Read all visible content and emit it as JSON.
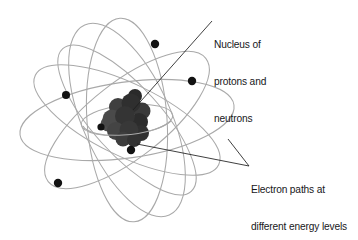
{
  "diagram": {
    "background_color": "#ffffff",
    "labels": {
      "nucleus": {
        "name": "nucleus-label",
        "lines": [
          "Nucleus of",
          "protons and",
          "neutrons"
        ],
        "line1": "Nucleus of",
        "line2": "protons and",
        "line3": "neutrons",
        "color": "#17171a"
      },
      "orbits": {
        "name": "electron-paths-label",
        "lines": [
          "Electron paths at",
          "different energy levels"
        ],
        "line1": "Electron paths at",
        "line2": "different energy levels",
        "color": "#17171a"
      }
    },
    "colors": {
      "orbit_stroke": "#a9a9a9",
      "electron_fill": "#121212",
      "nucleon_fill": "#3c3c3c",
      "nucleon_fill_dark": "#2b2b2b",
      "nucleon_fill_light": "#555555",
      "leader_line": "#1d1d1d"
    },
    "nucleus": {
      "center_x": 127,
      "center_y": 120,
      "nucleon_count": 13,
      "nucleons": [
        {
          "cx": 118,
          "cy": 107,
          "r": 9.0,
          "shade": "#3f3f3f"
        },
        {
          "cx": 131,
          "cy": 103,
          "r": 9.5,
          "shade": "#2f2f2f"
        },
        {
          "cx": 142,
          "cy": 111,
          "r": 8.5,
          "shade": "#3a3a3a"
        },
        {
          "cx": 112,
          "cy": 119,
          "r": 9.5,
          "shade": "#4a4a4a"
        },
        {
          "cx": 125,
          "cy": 116,
          "r": 10.0,
          "shade": "#343434"
        },
        {
          "cx": 139,
          "cy": 122,
          "r": 9.0,
          "shade": "#2c2c2c"
        },
        {
          "cx": 116,
          "cy": 131,
          "r": 9.0,
          "shade": "#444444"
        },
        {
          "cx": 129,
          "cy": 130,
          "r": 9.5,
          "shade": "#383838"
        },
        {
          "cx": 141,
          "cy": 133,
          "r": 8.0,
          "shade": "#303030"
        },
        {
          "cx": 123,
          "cy": 139,
          "r": 7.5,
          "shade": "#3d3d3d"
        },
        {
          "cx": 134,
          "cy": 140,
          "r": 7.0,
          "shade": "#333333"
        },
        {
          "cx": 108,
          "cy": 124,
          "r": 7.5,
          "shade": "#4f4f4f"
        },
        {
          "cx": 135,
          "cy": 96,
          "r": 7.0,
          "shade": "#2a2a2a"
        }
      ]
    },
    "orbits": [
      {
        "id": "orbit-1",
        "cx": 127,
        "cy": 120,
        "rx": 108,
        "ry": 38,
        "rotation": -8
      },
      {
        "id": "orbit-2",
        "cx": 127,
        "cy": 120,
        "rx": 102,
        "ry": 36,
        "rotation": 26
      },
      {
        "id": "orbit-3",
        "cx": 127,
        "cy": 120,
        "rx": 100,
        "ry": 38,
        "rotation": -38
      },
      {
        "id": "orbit-4",
        "cx": 127,
        "cy": 120,
        "rx": 104,
        "ry": 44,
        "rotation": 66
      },
      {
        "id": "orbit-5",
        "cx": 127,
        "cy": 120,
        "rx": 102,
        "ry": 40,
        "rotation": 86
      },
      {
        "id": "orbit-6",
        "cx": 127,
        "cy": 120,
        "rx": 96,
        "ry": 34,
        "rotation": 48
      },
      {
        "id": "orbit-7",
        "cx": 127,
        "cy": 120,
        "rx": 46,
        "ry": 15,
        "rotation": -6
      }
    ],
    "electrons": [
      {
        "id": "electron-1",
        "cx": 155,
        "cy": 44,
        "r": 4.2
      },
      {
        "id": "electron-2",
        "cx": 192,
        "cy": 81,
        "r": 4.2
      },
      {
        "id": "electron-3",
        "cx": 66,
        "cy": 95,
        "r": 4.0
      },
      {
        "id": "electron-4",
        "cx": 101,
        "cy": 127,
        "r": 3.6
      },
      {
        "id": "electron-5",
        "cx": 131,
        "cy": 150,
        "r": 4.2
      },
      {
        "id": "electron-6",
        "cx": 58,
        "cy": 183,
        "r": 4.2
      }
    ],
    "leaders": {
      "nucleus_leader": {
        "x1": 212,
        "y1": 21,
        "x2": 133,
        "y2": 110
      },
      "orbit_leader_a": {
        "x1": 249,
        "y1": 166,
        "x2": 137,
        "y2": 144
      },
      "orbit_leader_b": {
        "x1": 249,
        "y1": 166,
        "x2": 228,
        "y2": 139
      }
    }
  }
}
